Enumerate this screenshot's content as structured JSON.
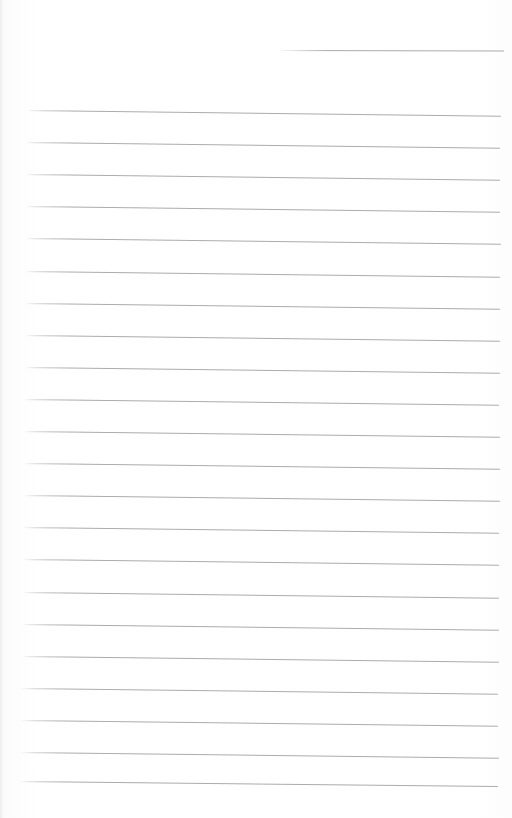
{
  "document": {
    "kind": "lined-notebook-page",
    "page_width": 512,
    "page_height": 818,
    "background_color": "#ffffff",
    "rule_color": "#a7a7ac",
    "rule_thickness_px": 1,
    "rule_spacing_px": 32.1,
    "visible_text": "",
    "handwriting_present": "no",
    "notes": "Blank ruled sheet: one short header rule near the top right, followed by 22 full-width ruled lines; all rules slope slightly downward from left to right."
  },
  "rules": {
    "header": {
      "label": "header-rule",
      "x1": 281,
      "y1": 50,
      "x2": 504,
      "y2": 50.5,
      "fade_left": true,
      "fade_right": false
    },
    "body_count": 22,
    "body": [
      {
        "index": 1,
        "x1": 27.5,
        "y1": 110.0,
        "x2": 500.5,
        "y2": 115.8
      },
      {
        "index": 2,
        "x1": 27.3,
        "y1": 142.1,
        "x2": 500.4,
        "y2": 147.9
      },
      {
        "index": 3,
        "x1": 27.0,
        "y1": 174.2,
        "x2": 500.3,
        "y2": 180.0
      },
      {
        "index": 4,
        "x1": 26.8,
        "y1": 206.3,
        "x2": 500.2,
        "y2": 212.1
      },
      {
        "index": 5,
        "x1": 26.5,
        "y1": 238.4,
        "x2": 500.1,
        "y2": 244.2
      },
      {
        "index": 6,
        "x1": 26.3,
        "y1": 270.5,
        "x2": 500.0,
        "y2": 276.3
      },
      {
        "index": 7,
        "x1": 26.0,
        "y1": 302.6,
        "x2": 499.9,
        "y2": 308.4
      },
      {
        "index": 8,
        "x1": 25.8,
        "y1": 334.7,
        "x2": 499.8,
        "y2": 340.5
      },
      {
        "index": 9,
        "x1": 25.5,
        "y1": 366.8,
        "x2": 499.7,
        "y2": 372.6
      },
      {
        "index": 10,
        "x1": 25.3,
        "y1": 398.9,
        "x2": 499.6,
        "y2": 404.7
      },
      {
        "index": 11,
        "x1": 25.0,
        "y1": 431.0,
        "x2": 499.5,
        "y2": 436.8
      },
      {
        "index": 12,
        "x1": 24.8,
        "y1": 463.1,
        "x2": 499.4,
        "y2": 468.9
      },
      {
        "index": 13,
        "x1": 24.5,
        "y1": 495.2,
        "x2": 499.3,
        "y2": 501.0
      },
      {
        "index": 14,
        "x1": 24.3,
        "y1": 527.3,
        "x2": 499.2,
        "y2": 533.1
      },
      {
        "index": 15,
        "x1": 24.0,
        "y1": 559.4,
        "x2": 499.1,
        "y2": 565.2
      },
      {
        "index": 16,
        "x1": 23.6,
        "y1": 591.5,
        "x2": 499.0,
        "y2": 597.3
      },
      {
        "index": 17,
        "x1": 23.2,
        "y1": 623.6,
        "x2": 498.8,
        "y2": 629.4
      },
      {
        "index": 18,
        "x1": 22.8,
        "y1": 655.7,
        "x2": 498.6,
        "y2": 661.5
      },
      {
        "index": 19,
        "x1": 22.4,
        "y1": 687.8,
        "x2": 498.4,
        "y2": 693.6
      },
      {
        "index": 20,
        "x1": 22.0,
        "y1": 719.9,
        "x2": 498.2,
        "y2": 725.7
      },
      {
        "index": 21,
        "x1": 21.5,
        "y1": 752.0,
        "x2": 498.0,
        "y2": 757.8
      },
      {
        "index": 22,
        "x1": 21.0,
        "y1": 781.0,
        "x2": 497.5,
        "y2": 786.0
      }
    ]
  }
}
